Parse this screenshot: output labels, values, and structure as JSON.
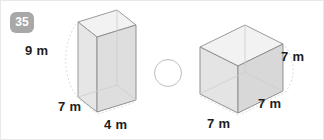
{
  "question": {
    "number": "35",
    "badge_color": "#a8a8a8"
  },
  "figures": {
    "left_prism": {
      "name": "rectangular-prism-left",
      "height_label": "9 m",
      "depth_label": "7 m",
      "width_label": "4 m",
      "height": 9,
      "depth": 7,
      "width": 4,
      "units": "m"
    },
    "right_prism": {
      "name": "cube-right",
      "height_label": "7 m",
      "depth_label": "7 m",
      "width_label": "7 m",
      "height": 7,
      "depth": 7,
      "width": 7,
      "units": "m"
    }
  },
  "answer_field": {
    "name": "comparison-circle",
    "value": ""
  },
  "colors": {
    "background": "#ffffff",
    "edge": "#8f8f8f",
    "hidden_edge": "#c9c9c9",
    "face_front": "#e3e3e3",
    "face_top": "#f1f1f1",
    "face_side": "#d6d6d6",
    "label_text": "#1d1d1d",
    "circle_stroke": "#bdbdbd"
  }
}
